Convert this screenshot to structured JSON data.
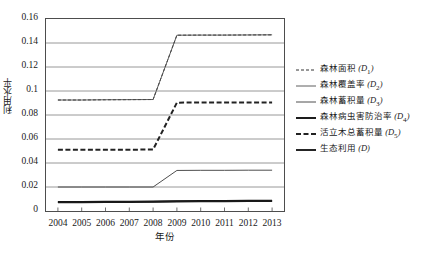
{
  "chart_data": {
    "type": "line",
    "title": "",
    "xlabel": "年份",
    "ylabel": "利用水平",
    "x": [
      2004,
      2005,
      2006,
      2007,
      2008,
      2009,
      2010,
      2011,
      2012,
      2013
    ],
    "xlim": [
      2003.5,
      2013.5
    ],
    "ylim": [
      0,
      0.16
    ],
    "yticks": [
      "0",
      "0.02",
      "0.04",
      "0.06",
      "0.08",
      "0.1",
      "0.12",
      "0.14",
      "0.16"
    ],
    "ytick_values": [
      0,
      0.02,
      0.04,
      0.06,
      0.08,
      0.1,
      0.12,
      0.14,
      0.16
    ],
    "xticks": [
      "2004",
      "2005",
      "2006",
      "2007",
      "2008",
      "2009",
      "2010",
      "2011",
      "2012",
      "2013"
    ],
    "grid": "horizontal",
    "legend_position": "right",
    "series": [
      {
        "name": "森林面积 (D1)",
        "label_main": "森林面积",
        "label_sub": "(D",
        "sub_index": "1",
        "style": "dashed-thin",
        "color": "#333333",
        "values": [
          0.0925,
          0.0925,
          0.0927,
          0.0928,
          0.0929,
          0.1465,
          0.1466,
          0.1466,
          0.1467,
          0.1468
        ]
      },
      {
        "name": "森林覆盖率 (D2)",
        "label_main": "森林覆盖率",
        "label_sub": "(D",
        "sub_index": "2",
        "style": "solid-thin",
        "color": "#4d4d4d",
        "values": [
          0.0925,
          0.0925,
          0.0927,
          0.0928,
          0.0929,
          0.1465,
          0.1466,
          0.1466,
          0.1467,
          0.1468
        ]
      },
      {
        "name": "森林蓄积量 (D3)",
        "label_main": "森林蓄积量",
        "label_sub": "(D",
        "sub_index": "3",
        "style": "solid-medium",
        "color": "#3a3a3a",
        "values": [
          0.02,
          0.02,
          0.02,
          0.02,
          0.02,
          0.0338,
          0.0339,
          0.0339,
          0.034,
          0.034
        ]
      },
      {
        "name": "森林病虫害防治率 (D4)",
        "label_main": "森林病虫害防治率",
        "label_sub": "(D",
        "sub_index": "4",
        "style": "solid-thick",
        "color": "#111111",
        "values": [
          0.0075,
          0.0076,
          0.0077,
          0.0078,
          0.0079,
          0.0082,
          0.0083,
          0.0084,
          0.0085,
          0.0086
        ]
      },
      {
        "name": "活立木总蓄积量 (D5)",
        "label_main": "活立木总蓄积量",
        "label_sub": "(D",
        "sub_index": "5",
        "style": "dashed-thick",
        "color": "#222222",
        "values": [
          0.051,
          0.051,
          0.0511,
          0.0511,
          0.0512,
          0.0903,
          0.0904,
          0.0904,
          0.0905,
          0.0905
        ]
      },
      {
        "name": "生态利用 (D)",
        "label_main": "生态利用",
        "label_sub": "(D",
        "sub_index": "",
        "style": "solid-thick",
        "color": "#1a1a1a",
        "values": [
          0.0072,
          0.0073,
          0.0074,
          0.0075,
          0.0076,
          0.0079,
          0.008,
          0.0081,
          0.0082,
          0.0083
        ]
      }
    ]
  },
  "colors": {
    "frame": "#4d4d4d",
    "grid": "#8c8c8c",
    "text": "#1a1a1a",
    "background": "#ffffff"
  }
}
